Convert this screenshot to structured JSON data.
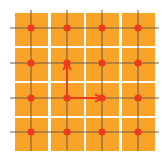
{
  "diagram": {
    "type": "square-lattice",
    "rows": 4,
    "cols": 4,
    "colors": {
      "background": "#ffffff",
      "cell": "#F9A328",
      "gridline": "#6E5A48",
      "lattice_point": "#EF3B1C",
      "vector": "#EF3B1C"
    },
    "cells": {
      "x_starts": [
        15,
        51,
        86,
        122
      ],
      "y_starts": [
        13,
        48,
        83,
        118
      ],
      "size": 33
    },
    "lines": {
      "x_positions": [
        31,
        67,
        102,
        138
      ],
      "y_positions": [
        28,
        63,
        98,
        132
      ],
      "extent_min": 10,
      "extent_max_x": 159,
      "extent_max_y": 151
    },
    "lattice_points_radius": 3.6,
    "vectors": [
      {
        "name": "a1",
        "from": [
          67,
          98
        ],
        "to": [
          102,
          98
        ]
      },
      {
        "name": "a2",
        "from": [
          67,
          98
        ],
        "to": [
          67,
          63
        ]
      }
    ]
  }
}
